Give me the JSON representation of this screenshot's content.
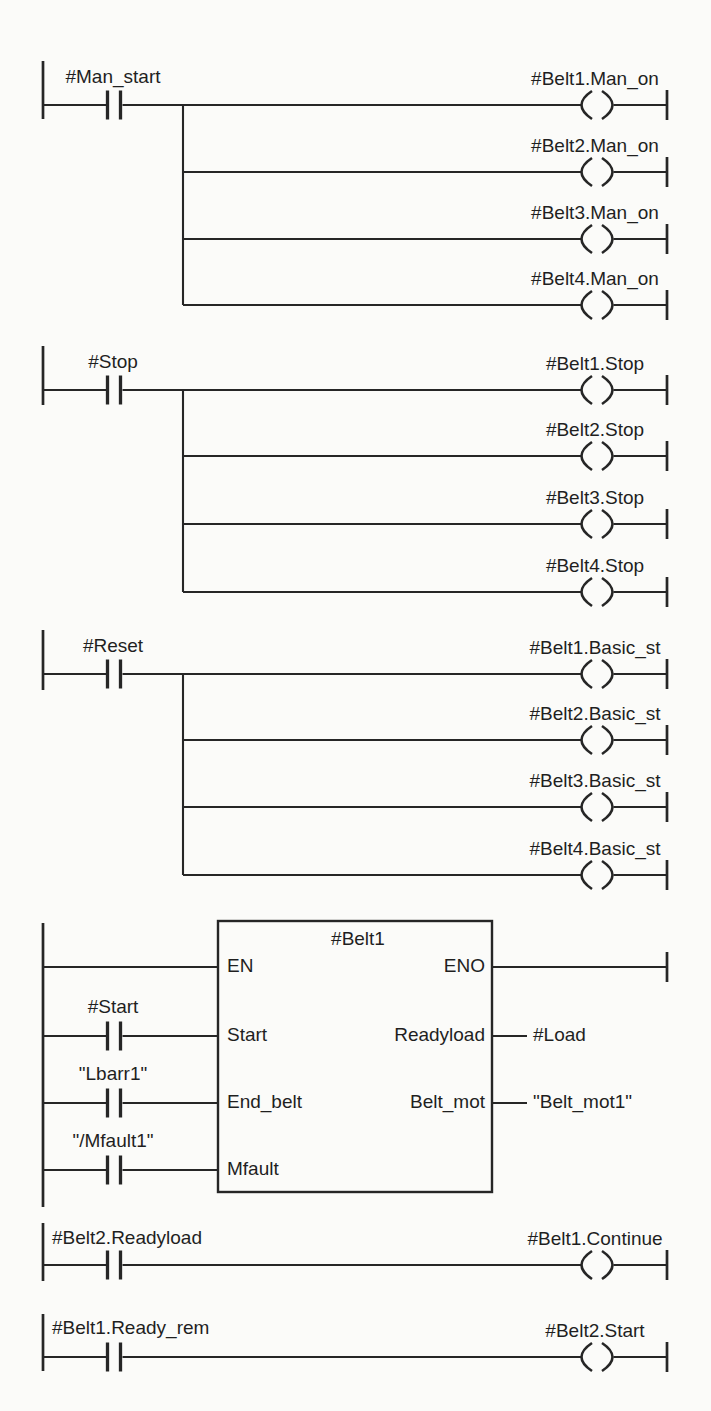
{
  "diagram_kind": "ladder-logic",
  "colors": {
    "background": "#fbfbf9",
    "line": "#262626",
    "text": "#1f1f1f"
  },
  "networks": [
    {
      "contact": "#Man_start",
      "coils": [
        "#Belt1.Man_on",
        "#Belt2.Man_on",
        "#Belt3.Man_on",
        "#Belt4.Man_on"
      ]
    },
    {
      "contact": "#Stop",
      "coils": [
        "#Belt1.Stop",
        "#Belt2.Stop",
        "#Belt3.Stop",
        "#Belt4.Stop"
      ]
    },
    {
      "contact": "#Reset",
      "coils": [
        "#Belt1.Basic_st",
        "#Belt2.Basic_st",
        "#Belt3.Basic_st",
        "#Belt4.Basic_st"
      ]
    },
    {
      "block": {
        "title": "#Belt1",
        "input_pins": [
          "EN",
          "Start",
          "End_belt",
          "Mfault"
        ],
        "output_pins": [
          "ENO",
          "Readyload",
          "Belt_mot"
        ],
        "input_contacts": [
          "#Start",
          "\"Lbarr1\"",
          "\"/Mfault1\""
        ],
        "output_operands": [
          "#Load",
          "\"Belt_mot1\""
        ]
      }
    },
    {
      "contact": "#Belt2.Readyload",
      "coils": [
        "#Belt1.Continue"
      ]
    },
    {
      "contact": "#Belt1.Ready_rem",
      "coils": [
        "#Belt2.Start"
      ]
    }
  ]
}
